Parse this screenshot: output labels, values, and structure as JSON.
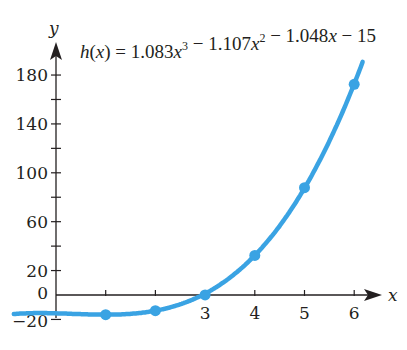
{
  "chart_data": {
    "type": "line",
    "equation": {
      "lhs": "h(x)",
      "text": "h(x) = 1.083x³ − 1.107x² − 1.048x − 15",
      "coefficients": [
        1.083,
        -1.107,
        -1.048,
        -15
      ]
    },
    "xlabel": "x",
    "ylabel": "y",
    "xlim": [
      0,
      6.3
    ],
    "ylim": [
      -20,
      190
    ],
    "x_ticks": [
      1,
      2,
      3,
      4,
      5,
      6
    ],
    "x_tick_labels": [
      "3",
      "4",
      "5",
      "6"
    ],
    "y_ticks": [
      -20,
      0,
      20,
      40,
      60,
      80,
      100,
      120,
      140,
      160,
      180
    ],
    "y_tick_labels": [
      "−20",
      "0",
      "20",
      "60",
      "100",
      "140",
      "180"
    ],
    "grid": false,
    "series": [
      {
        "name": "h(x)",
        "color": "#3aa3e3",
        "points": [
          {
            "x": 1,
            "y": -16.07
          },
          {
            "x": 2,
            "y": -12.86
          },
          {
            "x": 3,
            "y": 0.06
          },
          {
            "x": 4,
            "y": 32.34
          },
          {
            "x": 5,
            "y": 87.84
          },
          {
            "x": 6,
            "y": 172.43
          }
        ]
      }
    ]
  },
  "colors": {
    "curve": "#3aa3e3",
    "axis": "#231f20"
  }
}
